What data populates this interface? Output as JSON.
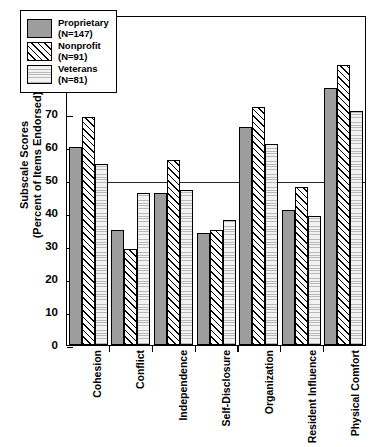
{
  "chart_data": {
    "type": "bar",
    "title": "",
    "xlabel": "",
    "ylabel": "Subscale Scores (Percent of Items Endorsed)",
    "ylabel_lines": [
      "Subscale Scores",
      "(Percent of Items Endorsed)"
    ],
    "categories": [
      "Cohesion",
      "Conflict",
      "Independence",
      "Self-Disclosure",
      "Organization",
      "Resident Influence",
      "Physical Comfort"
    ],
    "series": [
      {
        "name": "Proprietary",
        "n_label": "(N=147)",
        "fill": "solid-gray",
        "color": "#9d9d9d",
        "values": [
          60,
          35,
          46,
          34,
          66,
          41,
          78
        ]
      },
      {
        "name": "Nonprofit",
        "n_label": "(N=91)",
        "fill": "diagonal-hatch",
        "color": "#ffffff",
        "values": [
          69,
          29,
          56,
          35,
          72,
          48,
          85
        ]
      },
      {
        "name": "Veterans",
        "n_label": "(N=81)",
        "fill": "horizontal-lines",
        "color": "#eeeeee",
        "values": [
          55,
          46,
          47,
          38,
          61,
          39,
          71
        ]
      }
    ],
    "ylim": [
      0,
      100
    ],
    "yticks": [
      0,
      10,
      20,
      30,
      40,
      50,
      60,
      70,
      80,
      90,
      100
    ],
    "ytick_labels": [
      "0",
      "10",
      "20",
      "30",
      "40",
      "50",
      "60",
      "70",
      "80",
      "90",
      "100"
    ],
    "reference_line": {
      "value": 50,
      "style": "solid",
      "color": "#000000"
    },
    "grid": false,
    "legend_position": "top-left"
  },
  "legend": {
    "entries": [
      {
        "label": "Proprietary",
        "sub": "(N=147)"
      },
      {
        "label": "Nonprofit",
        "sub": "(N=91)"
      },
      {
        "label": "Veterans",
        "sub": "(N=81)"
      }
    ]
  }
}
